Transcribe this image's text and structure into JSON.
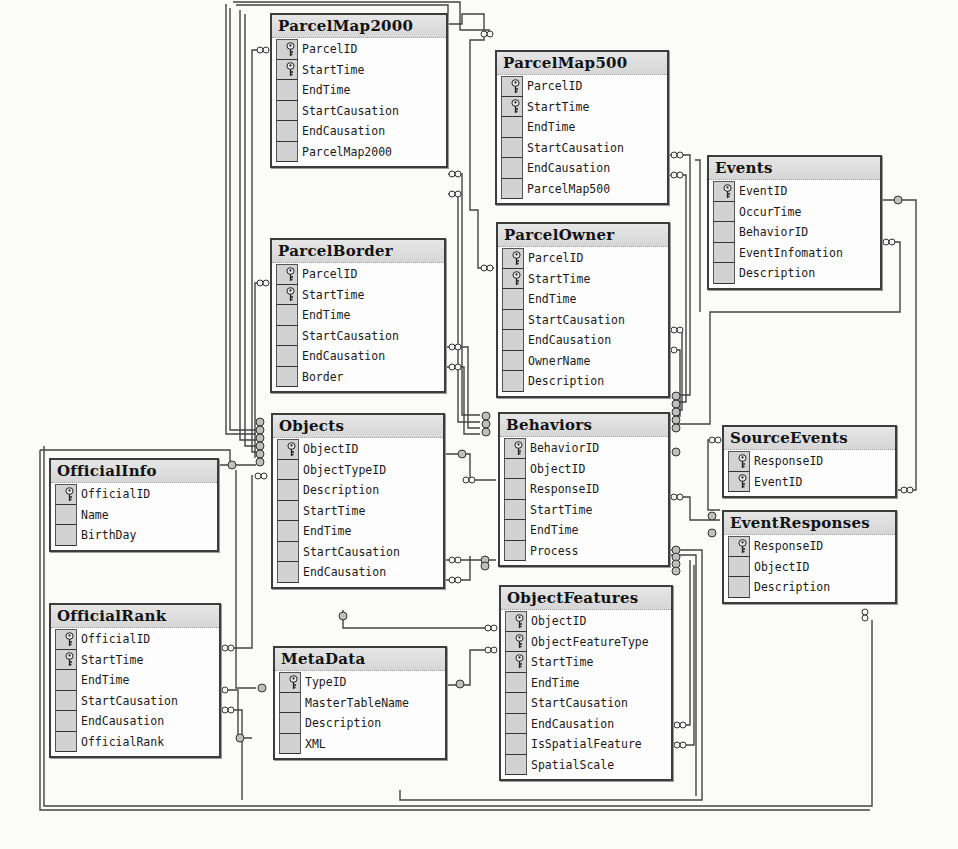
{
  "diagram": {
    "type": "database-relationship-diagram",
    "colors": {
      "background": "#fbfbfa",
      "table_border": "#3c3c3c",
      "header_fill": "#dcdcdc",
      "key_column_fill": "#d2d2d2",
      "connector": "#444444"
    },
    "tables": [
      {
        "name": "ParcelMap2000",
        "x": 270,
        "y": 13,
        "w": 178,
        "columns": [
          {
            "name": "ParcelID",
            "pk": true
          },
          {
            "name": "StartTime",
            "pk": true
          },
          {
            "name": "EndTime",
            "pk": false
          },
          {
            "name": "StartCausation",
            "pk": false
          },
          {
            "name": "EndCausation",
            "pk": false
          },
          {
            "name": "ParcelMap2000",
            "pk": false
          }
        ]
      },
      {
        "name": "ParcelMap500",
        "x": 495,
        "y": 50,
        "w": 174,
        "columns": [
          {
            "name": "ParcelID",
            "pk": true
          },
          {
            "name": "StartTime",
            "pk": true
          },
          {
            "name": "EndTime",
            "pk": false
          },
          {
            "name": "StartCausation",
            "pk": false
          },
          {
            "name": "EndCausation",
            "pk": false
          },
          {
            "name": "ParcelMap500",
            "pk": false
          }
        ]
      },
      {
        "name": "Events",
        "x": 707,
        "y": 155,
        "w": 175,
        "columns": [
          {
            "name": "EventID",
            "pk": true
          },
          {
            "name": "OccurTime",
            "pk": false
          },
          {
            "name": "BehaviorID",
            "pk": false
          },
          {
            "name": "EventInfomation",
            "pk": false
          },
          {
            "name": "Description",
            "pk": false
          }
        ]
      },
      {
        "name": "ParcelBorder",
        "x": 270,
        "y": 238,
        "w": 176,
        "columns": [
          {
            "name": "ParcelID",
            "pk": true
          },
          {
            "name": "StartTime",
            "pk": true
          },
          {
            "name": "EndTime",
            "pk": false
          },
          {
            "name": "StartCausation",
            "pk": false
          },
          {
            "name": "EndCausation",
            "pk": false
          },
          {
            "name": "Border",
            "pk": false
          }
        ]
      },
      {
        "name": "ParcelOwner",
        "x": 496,
        "y": 222,
        "w": 174,
        "columns": [
          {
            "name": "ParcelID",
            "pk": true
          },
          {
            "name": "StartTime",
            "pk": true
          },
          {
            "name": "EndTime",
            "pk": false
          },
          {
            "name": "StartCausation",
            "pk": false
          },
          {
            "name": "EndCausation",
            "pk": false
          },
          {
            "name": "OwnerName",
            "pk": false
          },
          {
            "name": "Description",
            "pk": false
          }
        ]
      },
      {
        "name": "Objects",
        "x": 271,
        "y": 413,
        "w": 174,
        "columns": [
          {
            "name": "ObjectID",
            "pk": true
          },
          {
            "name": "ObjectTypeID",
            "pk": false
          },
          {
            "name": "Description",
            "pk": false
          },
          {
            "name": "StartTime",
            "pk": false
          },
          {
            "name": "EndTime",
            "pk": false
          },
          {
            "name": "StartCausation",
            "pk": false
          },
          {
            "name": "EndCausation",
            "pk": false
          }
        ]
      },
      {
        "name": "Behaviors",
        "x": 498,
        "y": 412,
        "w": 172,
        "columns": [
          {
            "name": "BehaviorID",
            "pk": true
          },
          {
            "name": "ObjectID",
            "pk": false
          },
          {
            "name": "ResponseID",
            "pk": false
          },
          {
            "name": "StartTime",
            "pk": false
          },
          {
            "name": "EndTime",
            "pk": false
          },
          {
            "name": "Process",
            "pk": false
          }
        ]
      },
      {
        "name": "SourceEvents",
        "x": 722,
        "y": 425,
        "w": 175,
        "columns": [
          {
            "name": "ResponseID",
            "pk": true
          },
          {
            "name": "EventID",
            "pk": true
          }
        ]
      },
      {
        "name": "EventResponses",
        "x": 722,
        "y": 510,
        "w": 175,
        "columns": [
          {
            "name": "ResponseID",
            "pk": true
          },
          {
            "name": "ObjectID",
            "pk": false
          },
          {
            "name": "Description",
            "pk": false
          }
        ]
      },
      {
        "name": "OfficialInfo",
        "x": 49,
        "y": 458,
        "w": 170,
        "columns": [
          {
            "name": "OfficialID",
            "pk": true
          },
          {
            "name": "Name",
            "pk": false
          },
          {
            "name": "BirthDay",
            "pk": false
          }
        ]
      },
      {
        "name": "OfficialRank",
        "x": 49,
        "y": 603,
        "w": 172,
        "columns": [
          {
            "name": "OfficialID",
            "pk": true
          },
          {
            "name": "StartTime",
            "pk": true
          },
          {
            "name": "EndTime",
            "pk": false
          },
          {
            "name": "StartCausation",
            "pk": false
          },
          {
            "name": "EndCausation",
            "pk": false
          },
          {
            "name": "OfficialRank",
            "pk": false
          }
        ]
      },
      {
        "name": "MetaData",
        "x": 273,
        "y": 646,
        "w": 174,
        "columns": [
          {
            "name": "TypeID",
            "pk": true
          },
          {
            "name": "MasterTableName",
            "pk": false
          },
          {
            "name": "Description",
            "pk": false
          },
          {
            "name": "XML",
            "pk": false
          }
        ]
      },
      {
        "name": "ObjectFeatures",
        "x": 499,
        "y": 585,
        "w": 174,
        "columns": [
          {
            "name": "ObjectID",
            "pk": true
          },
          {
            "name": "ObjectFeatureType",
            "pk": true
          },
          {
            "name": "StartTime",
            "pk": true
          },
          {
            "name": "EndTime",
            "pk": false
          },
          {
            "name": "StartCausation",
            "pk": false
          },
          {
            "name": "EndCausation",
            "pk": false
          },
          {
            "name": "IsSpatialFeature",
            "pk": false
          },
          {
            "name": "SpatialScale",
            "pk": false
          }
        ]
      }
    ],
    "icons": {
      "primary_key": "key-icon",
      "one_end": "key-connector-icon",
      "many_end": "infinity-connector-icon"
    }
  }
}
